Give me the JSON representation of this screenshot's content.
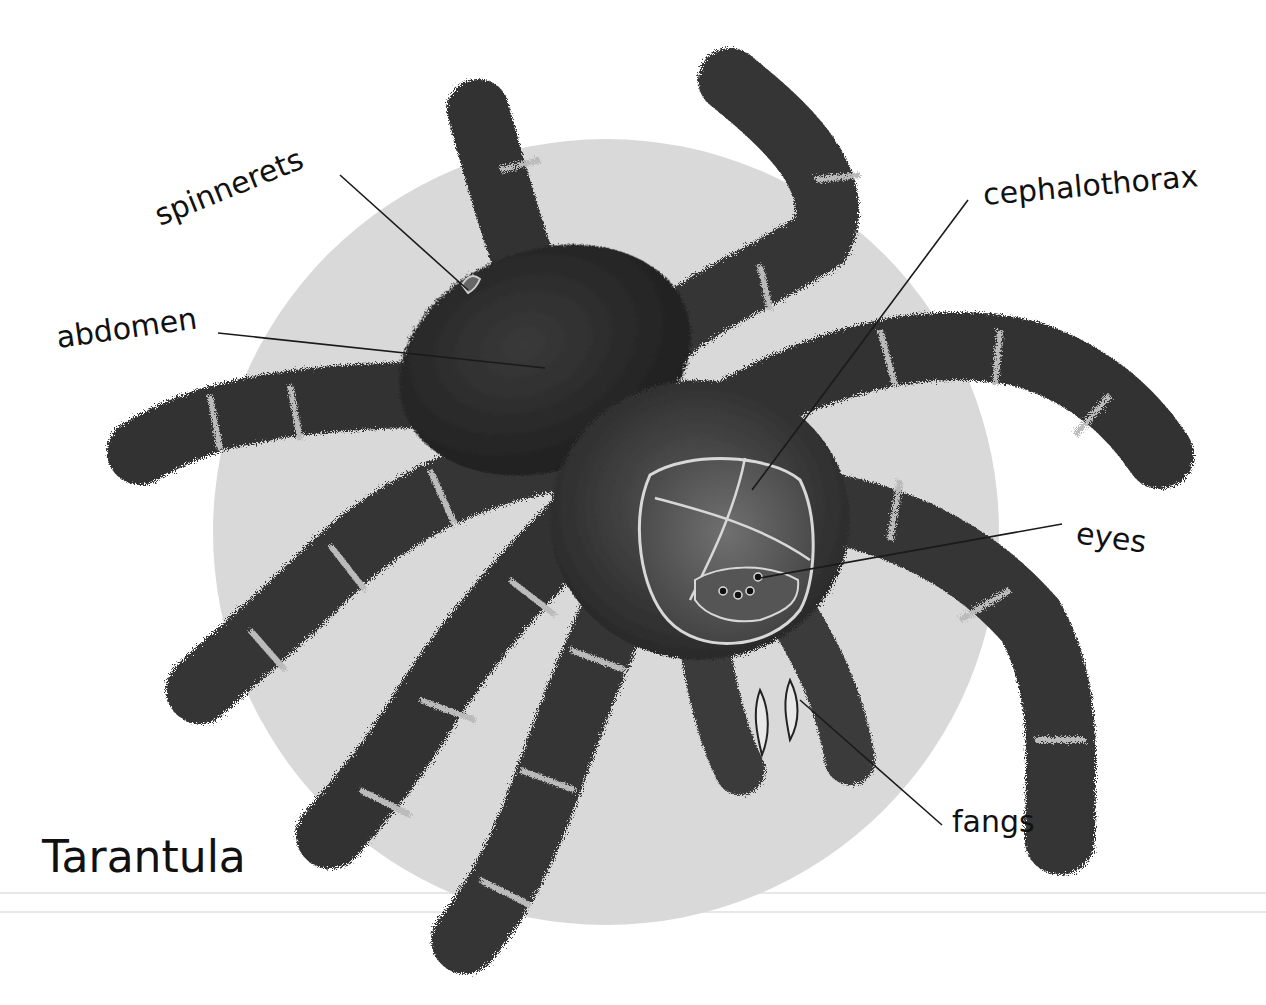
{
  "title": "Tarantula",
  "colors": {
    "background": "#ffffff",
    "disc": "#d9d9d9",
    "body_dark": "#2e2e2e",
    "body_mid": "#4a4a4a",
    "band_light": "#bdbdbd",
    "leader_line": "#1a1a1a",
    "text": "#111111"
  },
  "disc": {
    "cx": 606,
    "cy": 532,
    "r": 393
  },
  "labels": [
    {
      "id": "spinnerets",
      "text": "spinnerets",
      "x": 160,
      "y": 226,
      "rotate": -22,
      "line": [
        340,
        175,
        468,
        290
      ]
    },
    {
      "id": "abdomen",
      "text": "abdomen",
      "x": 58,
      "y": 348,
      "rotate": -8,
      "line": [
        218,
        333,
        545,
        368
      ]
    },
    {
      "id": "cephalothorax",
      "text": "cephalothorax",
      "x": 984,
      "y": 205,
      "rotate": -5,
      "line": [
        968,
        200,
        752,
        490
      ]
    },
    {
      "id": "eyes",
      "text": "eyes",
      "x": 1075,
      "y": 543,
      "rotate": 8,
      "line": [
        1062,
        524,
        760,
        578
      ]
    },
    {
      "id": "fangs",
      "text": "fangs",
      "x": 952,
      "y": 832,
      "rotate": 0,
      "line": [
        942,
        825,
        800,
        700
      ]
    }
  ],
  "title_pos": {
    "x": 42,
    "y": 872
  },
  "rules": [
    {
      "y": 893,
      "x1": 0,
      "x2": 1266
    },
    {
      "y": 912,
      "x1": 0,
      "x2": 1266
    }
  ]
}
